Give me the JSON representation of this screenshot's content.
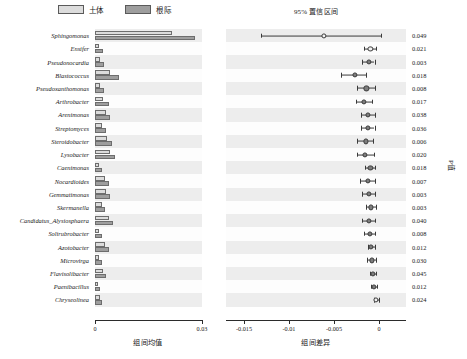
{
  "legend": {
    "items": [
      {
        "label": "土体",
        "color": "#dcdcdc",
        "name": "bulk-soil"
      },
      {
        "label": "根际",
        "color": "#9e9e9e",
        "name": "rhizosphere"
      }
    ]
  },
  "panels": {
    "left_axis_label": "组间均值",
    "right_title": "95% 置信区间",
    "right_axis_label": "组间差异",
    "pvalue_axis_label": "P值"
  },
  "axes": {
    "left_ticks": [
      "0",
      "0.03"
    ],
    "right_ticks": [
      "-0.015",
      "-0.01",
      "-0.005",
      "0"
    ]
  },
  "chart_data": {
    "type": "bar",
    "title": "",
    "subtitle": "",
    "xlabel": "组间均值",
    "ylabel": "",
    "xlim": [
      0,
      0.03
    ],
    "ci_xlim": [
      -0.017,
      0.003
    ],
    "ci_ticks": [
      -0.015,
      -0.01,
      -0.005,
      0
    ],
    "grid": false,
    "legend_position": "top",
    "categories": [
      "Sphingomonas",
      "Ensifer",
      "Pseudonocardia",
      "Blastococcus",
      "Pseudoxanthomonas",
      "Arthrobacter",
      "Arenimonas",
      "Streptomyces",
      "Steroidobacter",
      "Lysobacter",
      "Caenimonas",
      "Nocardioides",
      "Gemmatimonas",
      "Skermanella",
      "Candidatus_Alysiosphaera",
      "Solirubrobacter",
      "Azotobacter",
      "Microvirga",
      "Flavisolibacter",
      "Paenibacillus",
      "Chryseolinea"
    ],
    "series": [
      {
        "name": "土体",
        "color": "#dcdcdc",
        "values": [
          0.0215,
          0.0012,
          0.0013,
          0.0042,
          0.0013,
          0.0022,
          0.0031,
          0.0019,
          0.0035,
          0.0042,
          0.0011,
          0.0028,
          0.003,
          0.0021,
          0.004,
          0.0012,
          0.0029,
          0.0012,
          0.0022,
          0.0009,
          0.0015
        ]
      },
      {
        "name": "根际",
        "color": "#9e9e9e",
        "values": [
          0.028,
          0.0022,
          0.0024,
          0.0068,
          0.0026,
          0.0038,
          0.0042,
          0.003,
          0.0048,
          0.0056,
          0.002,
          0.004,
          0.0041,
          0.0029,
          0.005,
          0.0021,
          0.0038,
          0.0019,
          0.003,
          0.0014,
          0.0019
        ]
      }
    ],
    "confidence_intervals": [
      {
        "taxon": "Sphingomonas",
        "diff": -0.0061,
        "low": -0.0131,
        "high": 0.0002,
        "p": "0.049",
        "hollow": true
      },
      {
        "taxon": "Ensifer",
        "diff": -0.00095,
        "low": -0.00165,
        "high": -0.0003,
        "p": "0.021",
        "hollow": true
      },
      {
        "taxon": "Pseudonocardia",
        "diff": -0.00115,
        "low": -0.0019,
        "high": -0.0005,
        "p": "0.003",
        "hollow": false
      },
      {
        "taxon": "Blastococcus",
        "diff": -0.0027,
        "low": -0.0042,
        "high": -0.0014,
        "p": "0.018",
        "hollow": false
      },
      {
        "taxon": "Pseudoxanthomonas",
        "diff": -0.0014,
        "low": -0.0025,
        "high": -0.00045,
        "p": "0.008",
        "hollow": false
      },
      {
        "taxon": "Arthrobacter",
        "diff": -0.00165,
        "low": -0.00255,
        "high": -0.00075,
        "p": "0.017",
        "hollow": false
      },
      {
        "taxon": "Arenimonas",
        "diff": -0.0012,
        "low": -0.002,
        "high": -0.00045,
        "p": "0.038",
        "hollow": false
      },
      {
        "taxon": "Streptomyces",
        "diff": -0.0012,
        "low": -0.00195,
        "high": -0.0005,
        "p": "0.036",
        "hollow": false
      },
      {
        "taxon": "Steroidobacter",
        "diff": -0.0015,
        "low": -0.0024,
        "high": -0.00065,
        "p": "0.006",
        "hollow": false
      },
      {
        "taxon": "Lysobacter",
        "diff": -0.00155,
        "low": -0.0025,
        "high": -0.0006,
        "p": "0.020",
        "hollow": false
      },
      {
        "taxon": "Caenimonas",
        "diff": -0.00095,
        "low": -0.00155,
        "high": -0.0004,
        "p": "0.018",
        "hollow": false
      },
      {
        "taxon": "Nocardioides",
        "diff": -0.00125,
        "low": -0.00215,
        "high": -0.0004,
        "p": "0.007",
        "hollow": false
      },
      {
        "taxon": "Gemmatimonas",
        "diff": -0.0011,
        "low": -0.0019,
        "high": -0.0004,
        "p": "0.003",
        "hollow": false
      },
      {
        "taxon": "Skermanella",
        "diff": -0.0009,
        "low": -0.00145,
        "high": -0.00035,
        "p": "0.003",
        "hollow": false
      },
      {
        "taxon": "Candidatus_Alysiosphaera",
        "diff": -0.00115,
        "low": -0.00185,
        "high": -0.00045,
        "p": "0.040",
        "hollow": false
      },
      {
        "taxon": "Solirubrobacter",
        "diff": -0.001,
        "low": -0.00165,
        "high": -0.0004,
        "p": "0.008",
        "hollow": false
      },
      {
        "taxon": "Azotobacter",
        "diff": -0.0009,
        "low": -0.00125,
        "high": -0.0005,
        "p": "0.012",
        "hollow": false
      },
      {
        "taxon": "Microvirga",
        "diff": -0.0008,
        "low": -0.00135,
        "high": -0.0003,
        "p": "0.030",
        "hollow": false
      },
      {
        "taxon": "Flavisolibacter",
        "diff": -0.0007,
        "low": -0.00105,
        "high": -0.00035,
        "p": "0.045",
        "hollow": false
      },
      {
        "taxon": "Paenibacillus",
        "diff": -0.00055,
        "low": -0.00085,
        "high": -0.00025,
        "p": "0.012",
        "hollow": false
      },
      {
        "taxon": "Chryseolinea",
        "diff": -0.0003,
        "low": -0.0006,
        "high": -5e-05,
        "p": "0.024",
        "hollow": true
      }
    ]
  }
}
